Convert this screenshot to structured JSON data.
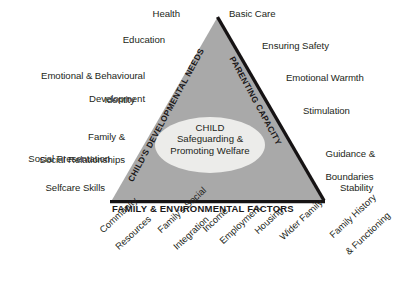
{
  "diagram": {
    "colors": {
      "triangle_fill": "#a9a9a9",
      "triangle_stroke": "#161314",
      "ellipse_fill": "#ececea",
      "text": "#231f20",
      "background": "#ffffff"
    },
    "centre": {
      "head": "CHILD",
      "line1": "Safeguarding &",
      "line2": "Promoting Welfare"
    },
    "edges": {
      "left_caption": "CHILD'S DEVELOPMENTAL NEEDS",
      "right_caption": "PARENTING CAPACITY",
      "base_caption": "FAMILY & ENVIRONMENTAL FACTORS"
    },
    "left_items": [
      {
        "id": "health",
        "text": "Health"
      },
      {
        "id": "education",
        "text": "Education"
      },
      {
        "id": "emotional-behavioural-development",
        "line1": "Emotional & Behavioural",
        "line2": "Development"
      },
      {
        "id": "identity",
        "text": "Identity"
      },
      {
        "id": "family-social-relationships",
        "line1": "Family &",
        "line2": "Social Relationships"
      },
      {
        "id": "social-presentation",
        "text": "Social Presentation"
      },
      {
        "id": "selfcare-skills",
        "text": "Selfcare Skills"
      }
    ],
    "right_items": [
      {
        "id": "basic-care",
        "text": "Basic Care"
      },
      {
        "id": "ensuring-safety",
        "text": "Ensuring Safety"
      },
      {
        "id": "emotional-warmth",
        "text": "Emotional Warmth"
      },
      {
        "id": "stimulation",
        "text": "Stimulation"
      },
      {
        "id": "guidance-boundaries",
        "line1": "Guidance &",
        "line2": "Boundaries"
      },
      {
        "id": "stability",
        "text": "Stability"
      }
    ],
    "bottom_items": [
      {
        "id": "community-resources",
        "line1": "Community",
        "line2": "Resources"
      },
      {
        "id": "familys-social-integration",
        "line1": "Family's Social",
        "line2": "Integration"
      },
      {
        "id": "income",
        "line1": "Income",
        "line2": ""
      },
      {
        "id": "employment",
        "line1": "Employment",
        "line2": ""
      },
      {
        "id": "housing",
        "line1": "Housing",
        "line2": ""
      },
      {
        "id": "wider-family",
        "line1": "Wider Family",
        "line2": ""
      },
      {
        "id": "family-history-functioning",
        "line1": "Family History",
        "line2": "& Functioning"
      }
    ]
  }
}
